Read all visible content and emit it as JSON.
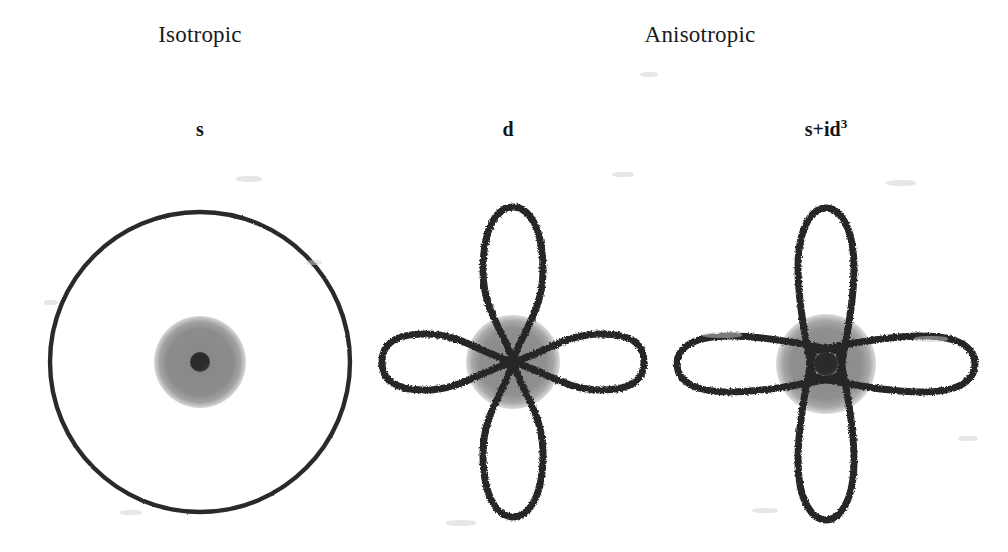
{
  "figure": {
    "title_text": "Superconducting gap symmetry diagrams",
    "background_color": "#ffffff",
    "ink_color": "#262626",
    "shading_color": "#8a8a8a",
    "core_color": "#2b2b2b"
  },
  "group_labels": [
    {
      "text": "Isotropic",
      "x": 200,
      "y": 22
    },
    {
      "text": "Anisotropic",
      "x": 700,
      "y": 22
    }
  ],
  "panels": [
    {
      "id": "s-wave",
      "label_main": "s",
      "label_sup": "",
      "label_x": 200,
      "label_y": 118,
      "center_x": 200,
      "center_y": 362,
      "outline_kind": "circle",
      "outline_radius": 150,
      "shade_radius": 46,
      "core_radius": 10,
      "lobes": 0,
      "node_type": "nodeless",
      "description": "Isotropic s-wave gap: uniform circular gap magnitude in all directions."
    },
    {
      "id": "d-wave",
      "label_main": "d",
      "label_sup": "",
      "label_x": 508,
      "label_y": 118,
      "center_x": 513,
      "center_y": 362,
      "outline_kind": "four-lobe-clover",
      "lobe_length_x": 131,
      "lobe_length_y": 155,
      "lobe_width": 84,
      "shade_radius": 47,
      "core_radius": 0,
      "lobes": 4,
      "node_type": "nodes-at-center",
      "description": "Anisotropic d-wave gap: four lobes meeting at nodal points where the gap vanishes."
    },
    {
      "id": "s-plus-id3-wave",
      "label_main": "s+id",
      "label_sup": "3",
      "label_x": 826,
      "label_y": 118,
      "center_x": 826,
      "center_y": 364,
      "outline_kind": "four-lobe-cross",
      "lobe_length_x": 149,
      "lobe_length_y": 156,
      "lobe_width": 56,
      "shade_radius": 50,
      "core_radius": 12,
      "lobes": 4,
      "node_type": "gapped-center",
      "description": "Mixed s+id3 state: four narrow lobes separated by a small residual gap with a finite core."
    }
  ],
  "specks": [
    {
      "x": 236,
      "y": 176,
      "w": 26,
      "h": 6
    },
    {
      "x": 612,
      "y": 172,
      "w": 22,
      "h": 5
    },
    {
      "x": 886,
      "y": 180,
      "w": 30,
      "h": 6
    },
    {
      "x": 306,
      "y": 260,
      "w": 16,
      "h": 5
    },
    {
      "x": 702,
      "y": 332,
      "w": 40,
      "h": 6
    },
    {
      "x": 914,
      "y": 336,
      "w": 34,
      "h": 6
    },
    {
      "x": 120,
      "y": 510,
      "w": 22,
      "h": 5
    },
    {
      "x": 446,
      "y": 520,
      "w": 30,
      "h": 6
    },
    {
      "x": 752,
      "y": 508,
      "w": 26,
      "h": 5
    },
    {
      "x": 640,
      "y": 72,
      "w": 18,
      "h": 5
    },
    {
      "x": 44,
      "y": 300,
      "w": 14,
      "h": 5
    },
    {
      "x": 958,
      "y": 436,
      "w": 20,
      "h": 5
    }
  ]
}
